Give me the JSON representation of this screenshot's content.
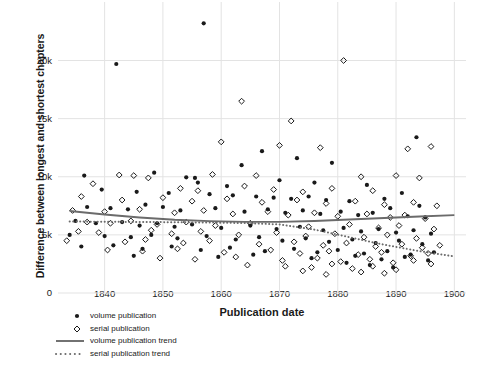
{
  "chart_data": {
    "type": "scatter",
    "title": "",
    "xlabel": "Publication date",
    "ylabel": "Difference between longest and shortest chapters",
    "xlim": [
      1832,
      1902
    ],
    "ylim": [
      0,
      24000
    ],
    "xticks": [
      "1840",
      "1850",
      "1860",
      "1870",
      "1880",
      "1890",
      "1900"
    ],
    "xtick_values": [
      1840,
      1850,
      1860,
      1870,
      1880,
      1890,
      1900
    ],
    "yticks": [
      "0",
      "5k",
      "10k",
      "15k",
      "20k"
    ],
    "ytick_values": [
      0,
      5000,
      10000,
      15000,
      20000
    ],
    "grid": true,
    "legend_position": "below-left",
    "series": [
      {
        "name": "volume publication",
        "marker": "filled-circle",
        "color": "#1a1a1a",
        "points": [
          [
            1857.0,
            23200
          ],
          [
            1842.0,
            19700
          ],
          [
            1893.5,
            13400
          ],
          [
            1867.0,
            12200
          ],
          [
            1873.0,
            11600
          ],
          [
            1879.0,
            11200
          ],
          [
            1863.5,
            11000
          ],
          [
            1848.5,
            10350
          ],
          [
            1836.5,
            10100
          ],
          [
            1854.0,
            9950
          ],
          [
            1855.5,
            9900
          ],
          [
            1856.0,
            9500
          ],
          [
            1870.0,
            9700
          ],
          [
            1876.0,
            9500
          ],
          [
            1885.0,
            9300
          ],
          [
            1861.0,
            9200
          ],
          [
            1839.5,
            8900
          ],
          [
            1845.5,
            8700
          ],
          [
            1851.0,
            8600
          ],
          [
            1858.0,
            8500
          ],
          [
            1862.0,
            8400
          ],
          [
            1866.0,
            8300
          ],
          [
            1869.0,
            8200
          ],
          [
            1872.0,
            8100
          ],
          [
            1875.0,
            8300
          ],
          [
            1878.0,
            8000
          ],
          [
            1882.0,
            7900
          ],
          [
            1888.0,
            8100
          ],
          [
            1891.0,
            8600
          ],
          [
            1894.0,
            7500
          ],
          [
            1837.0,
            7400
          ],
          [
            1841.0,
            7300
          ],
          [
            1844.0,
            7200
          ],
          [
            1847.0,
            7600
          ],
          [
            1850.0,
            7400
          ],
          [
            1853.0,
            7100
          ],
          [
            1859.0,
            7300
          ],
          [
            1864.0,
            7000
          ],
          [
            1868.0,
            7200
          ],
          [
            1871.0,
            6900
          ],
          [
            1874.0,
            7100
          ],
          [
            1877.0,
            6800
          ],
          [
            1880.5,
            7000
          ],
          [
            1883.5,
            6700
          ],
          [
            1886.0,
            6900
          ],
          [
            1889.0,
            7300
          ],
          [
            1892.0,
            6600
          ],
          [
            1895.0,
            6500
          ],
          [
            1835.0,
            6200
          ],
          [
            1838.5,
            6000
          ],
          [
            1843.0,
            6100
          ],
          [
            1846.0,
            5800
          ],
          [
            1849.0,
            6000
          ],
          [
            1852.0,
            5700
          ],
          [
            1855.0,
            5900
          ],
          [
            1860.0,
            5600
          ],
          [
            1865.0,
            5800
          ],
          [
            1869.5,
            5500
          ],
          [
            1873.5,
            5700
          ],
          [
            1877.5,
            5400
          ],
          [
            1881.0,
            5600
          ],
          [
            1884.0,
            5300
          ],
          [
            1887.0,
            5500
          ],
          [
            1890.0,
            5200
          ],
          [
            1893.0,
            5400
          ],
          [
            1896.0,
            5100
          ],
          [
            1834.0,
            5000
          ],
          [
            1840.0,
            4900
          ],
          [
            1844.5,
            4800
          ],
          [
            1848.0,
            5000
          ],
          [
            1852.5,
            4700
          ],
          [
            1857.5,
            4900
          ],
          [
            1862.5,
            4600
          ],
          [
            1866.5,
            4800
          ],
          [
            1870.5,
            4500
          ],
          [
            1874.5,
            4700
          ],
          [
            1878.5,
            4400
          ],
          [
            1882.5,
            4600
          ],
          [
            1886.5,
            4300
          ],
          [
            1890.5,
            4500
          ],
          [
            1894.5,
            4200
          ],
          [
            1836.0,
            4000
          ],
          [
            1841.5,
            4100
          ],
          [
            1846.5,
            3800
          ],
          [
            1851.5,
            4000
          ],
          [
            1856.5,
            3700
          ],
          [
            1861.5,
            3900
          ],
          [
            1867.5,
            3600
          ],
          [
            1872.5,
            3800
          ],
          [
            1876.5,
            3500
          ],
          [
            1880.0,
            3700
          ],
          [
            1884.5,
            3400
          ],
          [
            1888.5,
            3600
          ],
          [
            1892.5,
            3300
          ],
          [
            1896.5,
            3500
          ],
          [
            1845.0,
            3200
          ],
          [
            1859.5,
            3100
          ],
          [
            1865.5,
            3300
          ],
          [
            1875.5,
            3000
          ],
          [
            1883.0,
            3200
          ],
          [
            1887.5,
            2900
          ],
          [
            1891.5,
            3100
          ],
          [
            1895.5,
            2800
          ],
          [
            1881.5,
            2600
          ],
          [
            1885.5,
            2400
          ],
          [
            1889.5,
            2200
          ]
        ]
      },
      {
        "name": "serial publication",
        "marker": "open-diamond",
        "color": "#1a1a1a",
        "points": [
          [
            1881.0,
            20000
          ],
          [
            1863.5,
            16500
          ],
          [
            1872.0,
            14800
          ],
          [
            1860.0,
            13000
          ],
          [
            1870.0,
            12700
          ],
          [
            1877.0,
            12500
          ],
          [
            1892.0,
            12400
          ],
          [
            1896.0,
            12600
          ],
          [
            1842.5,
            10150
          ],
          [
            1845.0,
            10100
          ],
          [
            1847.5,
            9900
          ],
          [
            1858.5,
            10200
          ],
          [
            1866.0,
            10100
          ],
          [
            1884.0,
            10000
          ],
          [
            1890.0,
            10100
          ],
          [
            1894.0,
            9900
          ],
          [
            1838.0,
            9400
          ],
          [
            1853.0,
            9000
          ],
          [
            1856.0,
            8800
          ],
          [
            1864.0,
            9200
          ],
          [
            1869.0,
            8900
          ],
          [
            1874.0,
            8700
          ],
          [
            1879.0,
            9000
          ],
          [
            1886.0,
            8800
          ],
          [
            1836.0,
            8300
          ],
          [
            1843.0,
            8000
          ],
          [
            1850.0,
            8200
          ],
          [
            1855.0,
            7900
          ],
          [
            1861.0,
            8100
          ],
          [
            1867.0,
            7800
          ],
          [
            1873.0,
            8000
          ],
          [
            1878.0,
            7700
          ],
          [
            1883.0,
            7900
          ],
          [
            1888.0,
            7600
          ],
          [
            1893.0,
            7800
          ],
          [
            1897.0,
            7500
          ],
          [
            1834.5,
            7100
          ],
          [
            1840.0,
            7000
          ],
          [
            1846.0,
            7200
          ],
          [
            1852.0,
            6900
          ],
          [
            1857.0,
            7100
          ],
          [
            1862.0,
            6800
          ],
          [
            1868.0,
            7000
          ],
          [
            1871.5,
            6700
          ],
          [
            1876.0,
            6900
          ],
          [
            1880.0,
            6600
          ],
          [
            1885.0,
            6800
          ],
          [
            1889.0,
            6500
          ],
          [
            1891.5,
            6700
          ],
          [
            1895.0,
            6400
          ],
          [
            1837.0,
            6100
          ],
          [
            1841.0,
            6000
          ],
          [
            1844.5,
            6200
          ],
          [
            1849.0,
            5900
          ],
          [
            1854.0,
            6100
          ],
          [
            1859.0,
            5800
          ],
          [
            1865.0,
            6000
          ],
          [
            1875.0,
            5700
          ],
          [
            1882.0,
            5900
          ],
          [
            1887.0,
            5600
          ],
          [
            1890.5,
            5800
          ],
          [
            1896.5,
            5500
          ],
          [
            1835.5,
            5300
          ],
          [
            1839.0,
            5200
          ],
          [
            1848.0,
            5400
          ],
          [
            1851.5,
            5100
          ],
          [
            1856.5,
            5300
          ],
          [
            1863.0,
            5000
          ],
          [
            1869.5,
            5200
          ],
          [
            1874.5,
            4900
          ],
          [
            1879.5,
            5100
          ],
          [
            1884.5,
            4800
          ],
          [
            1888.5,
            5000
          ],
          [
            1893.5,
            4700
          ],
          [
            1833.5,
            4500
          ],
          [
            1843.5,
            4400
          ],
          [
            1847.0,
            4600
          ],
          [
            1853.5,
            4300
          ],
          [
            1858.0,
            4500
          ],
          [
            1866.5,
            4200
          ],
          [
            1872.5,
            4400
          ],
          [
            1877.5,
            4100
          ],
          [
            1881.5,
            4300
          ],
          [
            1886.5,
            4000
          ],
          [
            1891.0,
            4200
          ],
          [
            1894.5,
            3900
          ],
          [
            1897.5,
            4100
          ],
          [
            1840.5,
            3700
          ],
          [
            1846.5,
            3600
          ],
          [
            1852.5,
            3800
          ],
          [
            1860.5,
            3500
          ],
          [
            1868.5,
            3700
          ],
          [
            1873.5,
            3400
          ],
          [
            1878.5,
            3600
          ],
          [
            1883.5,
            3300
          ],
          [
            1887.5,
            3500
          ],
          [
            1892.5,
            3200
          ],
          [
            1895.5,
            3400
          ],
          [
            1849.5,
            3000
          ],
          [
            1855.5,
            2900
          ],
          [
            1862.5,
            3100
          ],
          [
            1870.5,
            2800
          ],
          [
            1876.5,
            3000
          ],
          [
            1880.5,
            2700
          ],
          [
            1885.5,
            2900
          ],
          [
            1889.5,
            2600
          ],
          [
            1893.0,
            2800
          ],
          [
            1896.0,
            2500
          ],
          [
            1864.5,
            2400
          ],
          [
            1871.0,
            2300
          ],
          [
            1875.5,
            2200
          ],
          [
            1879.0,
            2500
          ],
          [
            1882.5,
            2100
          ],
          [
            1886.0,
            2300
          ],
          [
            1890.0,
            2000
          ],
          [
            1884.0,
            1800
          ],
          [
            1888.0,
            1700
          ],
          [
            1878.0,
            1600
          ],
          [
            1874.0,
            1900
          ]
        ]
      }
    ],
    "trends": [
      {
        "name": "volume publication trend",
        "style": "solid",
        "color": "#6b6b6b",
        "points": [
          [
            1834,
            7050
          ],
          [
            1840,
            6750
          ],
          [
            1846,
            6500
          ],
          [
            1852,
            6300
          ],
          [
            1858,
            6180
          ],
          [
            1864,
            6120
          ],
          [
            1870,
            6120
          ],
          [
            1876,
            6200
          ],
          [
            1882,
            6320
          ],
          [
            1888,
            6450
          ],
          [
            1894,
            6580
          ],
          [
            1900,
            6700
          ]
        ]
      },
      {
        "name": "serial publication trend",
        "style": "dotted",
        "color": "#6b6b6b",
        "points": [
          [
            1834,
            6150
          ],
          [
            1840,
            6130
          ],
          [
            1846,
            6110
          ],
          [
            1852,
            6090
          ],
          [
            1858,
            6060
          ],
          [
            1864,
            6020
          ],
          [
            1870,
            5900
          ],
          [
            1876,
            5450
          ],
          [
            1882,
            4800
          ],
          [
            1888,
            4150
          ],
          [
            1894,
            3600
          ],
          [
            1900,
            3150
          ]
        ]
      }
    ]
  },
  "legend": {
    "items": [
      {
        "label": "volume publication",
        "marker": "filled-circle"
      },
      {
        "label": "serial publication",
        "marker": "open-diamond"
      },
      {
        "label": "volume publication trend",
        "marker": "solid-line"
      },
      {
        "label": "serial publication trend",
        "marker": "dotted-line"
      }
    ]
  },
  "colors": {
    "point": "#1a1a1a",
    "trend": "#6b6b6b",
    "grid": "#e3e3e3",
    "text": "#1a1a1a",
    "background": "#ffffff"
  }
}
